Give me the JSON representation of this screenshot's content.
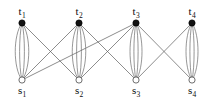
{
  "figure": {
    "kind": "bipartite-multigraph-diagram",
    "background_color": "#ffffff",
    "width": 206,
    "height": 101
  },
  "style": {
    "edge_color": "#5b5b5b",
    "edge_width": 0.7,
    "multi_edge_color": "#6a6a6a",
    "top_node_fill": "#111111",
    "top_node_stroke": "#000000",
    "bottom_node_fill": "#ffffff",
    "bottom_node_stroke": "#4a4a4a",
    "node_radius": 3.1,
    "label_color": "#0d0d0d"
  },
  "nodes": {
    "top": [
      {
        "id": "t1",
        "base": "t",
        "sub": "1",
        "x": 22,
        "y": 23,
        "label_x": 22,
        "label_y": 17
      },
      {
        "id": "t2",
        "base": "t",
        "sub": "2",
        "x": 79,
        "y": 23,
        "label_x": 79,
        "label_y": 17
      },
      {
        "id": "t3",
        "base": "t",
        "sub": "3",
        "x": 136,
        "y": 23,
        "label_x": 136,
        "label_y": 17
      },
      {
        "id": "t4",
        "base": "t",
        "sub": "4",
        "x": 192,
        "y": 23,
        "label_x": 192,
        "label_y": 17
      }
    ],
    "bottom": [
      {
        "id": "s1",
        "base": "s",
        "sub": "1",
        "x": 22,
        "y": 80,
        "label_x": 22,
        "label_y": 85
      },
      {
        "id": "s2",
        "base": "s",
        "sub": "2",
        "x": 79,
        "y": 80,
        "label_x": 79,
        "label_y": 85
      },
      {
        "id": "s3",
        "base": "s",
        "sub": "3",
        "x": 136,
        "y": 80,
        "label_x": 136,
        "label_y": 85
      },
      {
        "id": "s4",
        "base": "s",
        "sub": "4",
        "x": 192,
        "y": 80,
        "label_x": 192,
        "label_y": 85
      }
    ]
  },
  "multi_edges": [
    {
      "from": "t1",
      "to": "s1",
      "multiplicity": 4,
      "bulge": [
        -9,
        -3.2,
        3.2,
        9
      ]
    },
    {
      "from": "t2",
      "to": "s2",
      "multiplicity": 4,
      "bulge": [
        -9,
        -3.2,
        3.2,
        9
      ]
    },
    {
      "from": "t3",
      "to": "s3",
      "multiplicity": 4,
      "bulge": [
        -8,
        -2.8,
        2.8,
        8
      ]
    },
    {
      "from": "t4",
      "to": "s4",
      "multiplicity": 4,
      "bulge": [
        -8,
        -2.8,
        2.8,
        8
      ]
    }
  ],
  "cross_edges": [
    {
      "from": "t1",
      "to": "s2"
    },
    {
      "from": "t2",
      "to": "s1"
    },
    {
      "from": "t2",
      "to": "s3"
    },
    {
      "from": "t3",
      "to": "s1"
    },
    {
      "from": "t3",
      "to": "s2"
    },
    {
      "from": "t3",
      "to": "s4"
    },
    {
      "from": "t4",
      "to": "s3"
    }
  ]
}
